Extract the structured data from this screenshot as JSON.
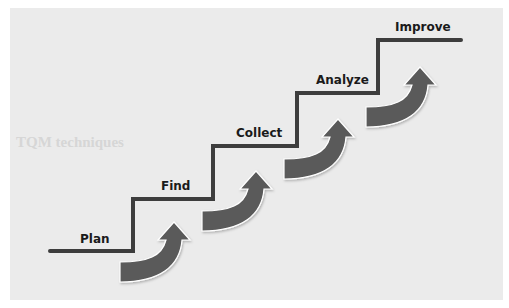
{
  "diagram": {
    "type": "staircase-process",
    "steps": [
      {
        "label": "Plan"
      },
      {
        "label": "Find"
      },
      {
        "label": "Collect"
      },
      {
        "label": "Analyze"
      },
      {
        "label": "Improve"
      }
    ],
    "arrow_count": 4,
    "colors": {
      "stair_line": "#3d3d3d",
      "arrow_fill": "#5a5a5a",
      "arrow_highlight": "#ffffff",
      "panel_background": "#ebebeb",
      "page_background": "#ffffff",
      "label_text": "#1a1a1a"
    }
  },
  "background": {
    "heading": "TQM techniques"
  }
}
